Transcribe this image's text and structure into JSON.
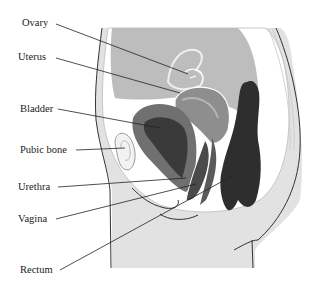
{
  "diagram": {
    "type": "anatomical-sagittal-section",
    "labels": [
      {
        "id": "ovary",
        "text": "Ovary"
      },
      {
        "id": "uterus",
        "text": "Uterus"
      },
      {
        "id": "bladder",
        "text": "Bladder"
      },
      {
        "id": "pubic-bone",
        "text": "Pubic bone"
      },
      {
        "id": "urethra",
        "text": "Urethra"
      },
      {
        "id": "vagina",
        "text": "Vagina"
      },
      {
        "id": "rectum",
        "text": "Rectum"
      }
    ],
    "colors": {
      "background": "#ffffff",
      "skin": "#e2e2e2",
      "abdominal_cavity": "#bdbdbd",
      "organ_mid": "#9a9a9a",
      "uterus": "#8e8e8e",
      "bladder_dark": "#3a3a3a",
      "rectum": "#2e2e2e",
      "outline": "#333333",
      "leader_line": "#222222"
    }
  }
}
